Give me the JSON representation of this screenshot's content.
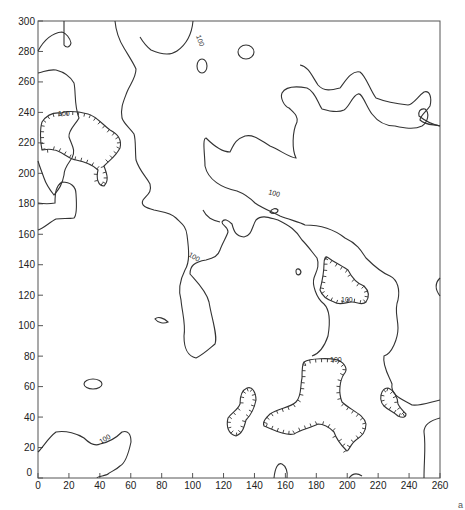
{
  "chart_data": {
    "type": "contour",
    "title": "",
    "xlabel": "",
    "ylabel": "",
    "xlim": [
      0,
      260
    ],
    "ylim": [
      0,
      300
    ],
    "x_ticks": [
      "0",
      "20",
      "40",
      "60",
      "80",
      "100",
      "120",
      "140",
      "160",
      "180",
      "200",
      "220",
      "240",
      "260"
    ],
    "y_ticks": [
      "0",
      "20",
      "40",
      "60",
      "80",
      "100",
      "120",
      "140",
      "160",
      "180",
      "200",
      "220",
      "240",
      "260",
      "280",
      "300"
    ],
    "grid": false,
    "contour_level": 100,
    "contour_labels": [
      {
        "text": "100",
        "x": 106,
        "y": 293
      },
      {
        "text": "100",
        "x": 150,
        "y": 210
      },
      {
        "text": "100",
        "x": 90,
        "y": 142
      },
      {
        "text": "100",
        "x": 12,
        "y": 146
      },
      {
        "text": "100",
        "x": 200,
        "y": 118
      },
      {
        "text": "100",
        "x": 196,
        "y": 79
      },
      {
        "text": "100",
        "x": 47,
        "y": 44
      }
    ],
    "depressions_hachured": [
      {
        "name": "left-basin",
        "approx_center": [
          15,
          128
        ]
      },
      {
        "name": "right-basin",
        "approx_center": [
          195,
          126
        ]
      },
      {
        "name": "lower-twin-basin",
        "approx_center": [
          135,
          40
        ]
      },
      {
        "name": "lower-large-basin",
        "approx_center": [
          180,
          50
        ]
      },
      {
        "name": "lower-right-basin",
        "approx_center": [
          232,
          52
        ]
      }
    ]
  },
  "corner_mark": "a"
}
